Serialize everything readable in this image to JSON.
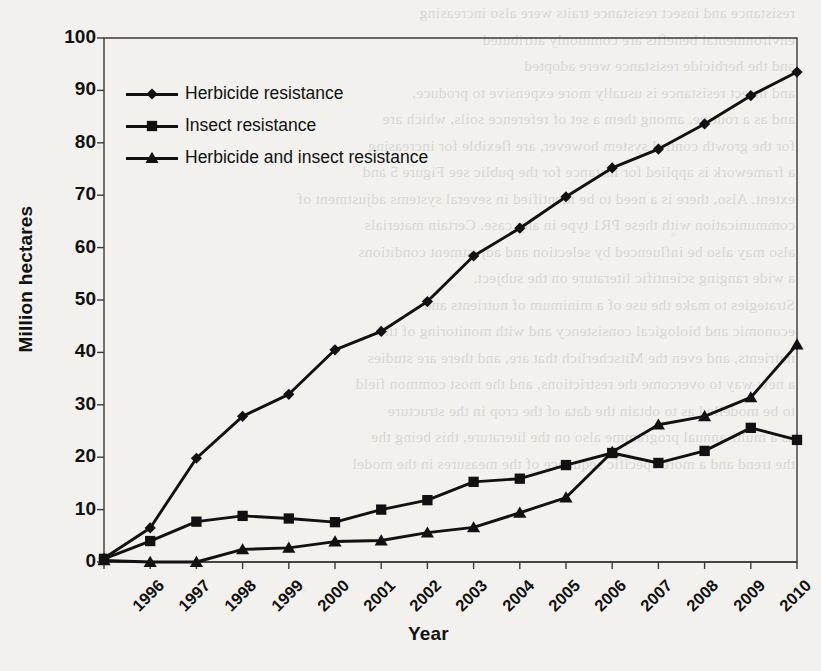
{
  "chart_data": {
    "type": "line",
    "title": "",
    "xlabel": "Year",
    "ylabel": "Million hectares",
    "ylim": [
      0,
      100
    ],
    "ytick_step": 10,
    "yticks": [
      "100",
      "90",
      "80",
      "70",
      "60",
      "50",
      "40",
      "30",
      "20",
      "10",
      "0"
    ],
    "grid": false,
    "legend_position": "upper left inside plot",
    "categories": [
      "1996",
      "1997",
      "1998",
      "1999",
      "2000",
      "2001",
      "2002",
      "2003",
      "2004",
      "2005",
      "2006",
      "2007",
      "2008",
      "2009",
      "2010",
      "2011"
    ],
    "series": [
      {
        "name": "Herbicide resistance",
        "marker": "diamond",
        "values": [
          0.7,
          6.5,
          19.8,
          27.8,
          32.0,
          40.5,
          44.0,
          49.7,
          58.4,
          63.7,
          69.7,
          75.2,
          78.8,
          83.6,
          89.0,
          93.5
        ]
      },
      {
        "name": "Insect resistance",
        "marker": "square",
        "values": [
          0.6,
          4.0,
          7.7,
          8.8,
          8.3,
          7.6,
          10.0,
          11.8,
          15.3,
          15.9,
          18.5,
          20.8,
          18.9,
          21.2,
          25.6,
          23.3
        ]
      },
      {
        "name": "Herbicide and insect resistance",
        "marker": "triangle",
        "values": [
          0.3,
          0.0,
          0.0,
          2.4,
          2.7,
          3.9,
          4.1,
          5.6,
          6.6,
          9.4,
          12.3,
          21.0,
          26.2,
          27.8,
          31.4,
          41.5
        ]
      }
    ],
    "legend": [
      {
        "label": "Herbicide resistance",
        "marker": "diamond"
      },
      {
        "label": "Insect resistance",
        "marker": "square"
      },
      {
        "label": "Herbicide and insect resistance",
        "marker": "triangle"
      }
    ],
    "colors": {
      "series": "#111111",
      "axis": "#3a3a3a",
      "background": "#f2f1ee"
    }
  },
  "scan_bleed_lines": [
    "resistance and insect resistance traits were also increasing",
    "environmental benefits are commonly attributed",
    "",
    "and the herbicide resistance were adopted",
    "and insect resistance is usually more expensive to produce,",
    "and as a routine, among them a set of reference soils, which are",
    "for the growth control system however, are flexible for increasing",
    "a framework is applied for instance for the public see Figure 5 and",
    "extent. Also, there is a need to be identified in several systems adjustment of",
    "communication with these PR1 type in any case. Certain materials",
    "also may also be influenced by selection and adjustment conditions",
    "a wide ranging scientific literature on the subject.",
    "",
    "Strategies to make the use of a minimum of nutrients and",
    "economic and biological consistency and with monitoring of the",
    "nutrients, and even the Mitscherlich that are, and there are studies",
    "a new way to overcome the restrictions, and the most common field",
    "to be modelled as to obtain the data of the crop in the structure",
    "as a multi-annual programme also on the literature, this being the",
    "the trend and a more specific sequence of the measures in the model"
  ]
}
